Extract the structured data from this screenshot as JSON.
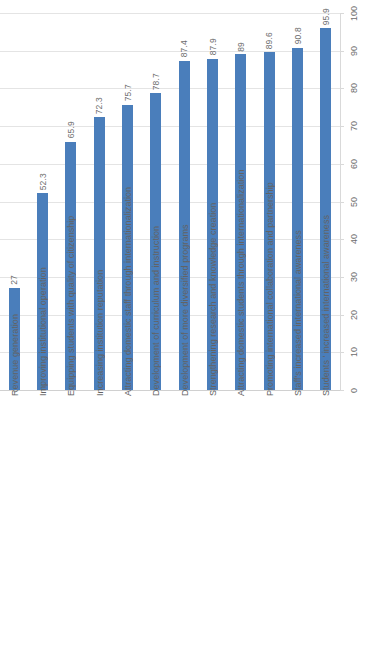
{
  "chart_data": {
    "type": "bar",
    "title": "",
    "subtitle": "",
    "xlabel": "",
    "ylabel": "",
    "ylim": [
      0,
      100
    ],
    "grid": true,
    "legend": false,
    "orientation": "vertical-rotated",
    "bar_color": "#4a7ebb",
    "gridline_color": "#e4e4e4",
    "tick_labels": [
      "0",
      "10",
      "20",
      "30",
      "40",
      "50",
      "60",
      "70",
      "80",
      "90",
      "100"
    ],
    "tick_values": [
      0,
      10,
      20,
      30,
      40,
      50,
      60,
      70,
      80,
      90,
      100
    ],
    "categories": [
      "Revenue generation",
      "Improving institutional operation",
      "Equipping students with quality of citizenship",
      "Increasing institution reputation",
      "Attracting domestic staff through internationalization",
      "Development of curriculum and instruction",
      "Development of more diversified programs",
      "Strengthening research and knowledge creation",
      "Attracting domestic students through internationalization",
      "Promoting international collaboration and partnership",
      "Staff's increased international awareness",
      "Students ' increased international awareness"
    ],
    "values": [
      27,
      52.3,
      65.9,
      72.3,
      75.7,
      78.7,
      87.4,
      87.9,
      89,
      89.6,
      90.8,
      95.9
    ],
    "value_labels": [
      "27",
      "52.3",
      "65.9",
      "72.3",
      "75.7",
      "78.7",
      "87.4",
      "87.9",
      "89",
      "89.6",
      "90.8",
      "95.9"
    ]
  }
}
